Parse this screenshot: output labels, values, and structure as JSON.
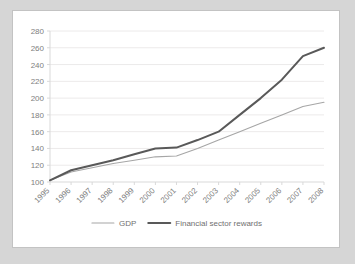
{
  "chart_data": {
    "type": "line",
    "title": "",
    "subtitle": "",
    "xlabel": "",
    "ylabel": "",
    "categories": [
      "1995",
      "1996",
      "1997",
      "1998",
      "1999",
      "2000",
      "2001",
      "2002",
      "2003",
      "2004",
      "2005",
      "2006",
      "2007",
      "2008"
    ],
    "x": [
      "1995",
      "1996",
      "1997",
      "1998",
      "1999",
      "2000",
      "2001",
      "2002",
      "2003",
      "2004",
      "2005",
      "2006",
      "2007",
      "2008"
    ],
    "series": [
      {
        "name": "GDP",
        "color": "#a6a6a6",
        "line_width": 1.1,
        "values": [
          102,
          112,
          117,
          122,
          126,
          130,
          131,
          140,
          150,
          160,
          170,
          180,
          190,
          195
        ]
      },
      {
        "name": "Financial sector rewards",
        "color": "#595959",
        "line_width": 2.0,
        "values": [
          102,
          114,
          120,
          126,
          133,
          140,
          141,
          150,
          160,
          180,
          200,
          222,
          250,
          260
        ]
      }
    ],
    "ylim": [
      100,
      280
    ],
    "ytick_step": 20,
    "yticks": [
      100,
      120,
      140,
      160,
      180,
      200,
      220,
      240,
      260,
      280
    ],
    "ytick_labels": [
      "100",
      "120",
      "140",
      "160",
      "180",
      "200",
      "220",
      "240",
      "260",
      "280"
    ],
    "grid": {
      "horizontal": true,
      "vertical": false
    },
    "legend": {
      "position": "bottom",
      "entries": [
        {
          "label": "GDP",
          "color": "#a6a6a6"
        },
        {
          "label": "Financial sector rewards",
          "color": "#595959"
        }
      ]
    },
    "xtick_rotation_deg": -45,
    "background": "#ffffff",
    "page_background": "#d6d6d6",
    "gridline_color": "#eceaea",
    "axis_color": "#d9d9d9",
    "tick_text_color": "#808080"
  }
}
